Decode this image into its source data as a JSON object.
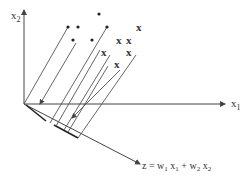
{
  "diagram": {
    "axes": {
      "x1_label": "x",
      "x1_sub": "1",
      "x2_label": "x",
      "x2_sub": "2",
      "z_label": "z = w",
      "z_w1_sub": "1",
      "z_mid": " x",
      "z_x1_sub": "1",
      "z_plus": " + w",
      "z_w2_sub": "2",
      "z_end": " x",
      "z_x2_sub": "2"
    },
    "class_dots": [
      [
        68,
        27
      ],
      [
        78,
        27
      ],
      [
        99,
        14
      ],
      [
        107,
        27
      ],
      [
        73,
        40
      ],
      [
        92,
        40
      ]
    ],
    "class_x": [
      [
        140,
        27
      ],
      [
        120,
        40
      ],
      [
        130,
        40
      ],
      [
        105,
        52
      ],
      [
        130,
        52
      ],
      [
        118,
        64
      ]
    ],
    "x_marker": "x",
    "colors": {
      "line": "#444444",
      "text": "#333333"
    }
  }
}
